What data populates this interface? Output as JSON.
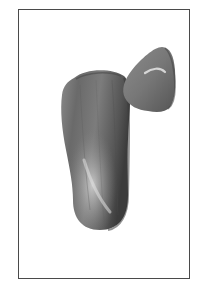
{
  "image": {
    "subject": "two polished stones",
    "background_color": "#ffffff",
    "frame": {
      "border_color": "#4a4a4a",
      "left": 18,
      "top": 9,
      "width": 172,
      "height": 270
    },
    "stones": [
      {
        "name": "large-elongated-stone",
        "base_color": "#6f6f6f",
        "highlight_color": "#d0d0d0",
        "shadow_color": "#3c3c3c"
      },
      {
        "name": "small-triangular-stone",
        "base_color": "#7a7a7a",
        "highlight_color": "#e0e0e0",
        "shadow_color": "#474747"
      }
    ]
  }
}
